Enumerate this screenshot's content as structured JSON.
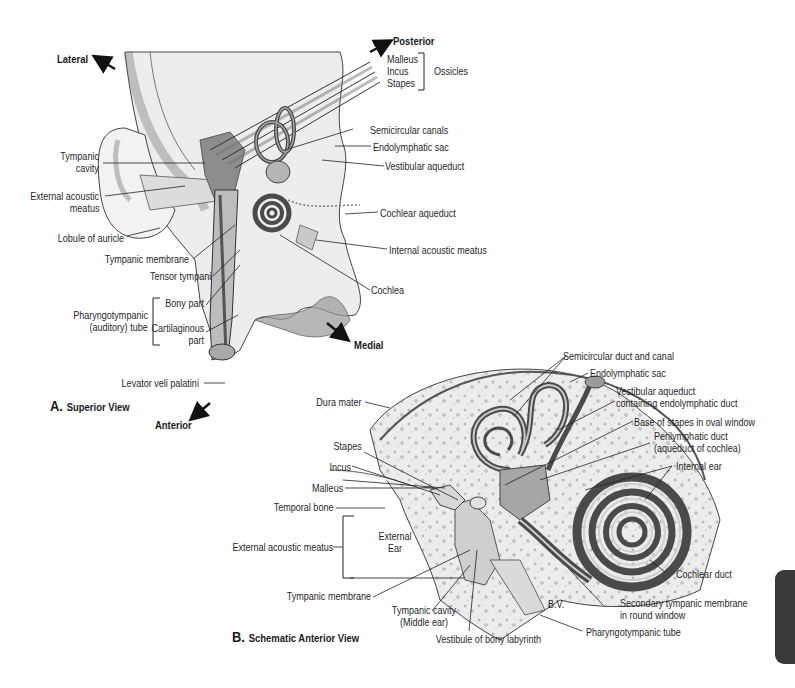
{
  "figure_a": {
    "caption_letter": "A.",
    "caption_text": "Superior View",
    "directions": {
      "lateral": "Lateral",
      "posterior": "Posterior",
      "medial": "Medial",
      "anterior": "Anterior"
    },
    "labels": {
      "malleus": "Malleus",
      "incus": "Incus",
      "stapes": "Stapes",
      "ossicles": "Ossicles",
      "semicircular_canals": "Semicircular canals",
      "endolymphatic_sac": "Endolymphatic sac",
      "vestibular_aqueduct": "Vestibular aqueduct",
      "cochlear_aqueduct": "Cochlear aqueduct",
      "internal_acoustic_meatus": "Internal acoustic meatus",
      "cochlea": "Cochlea",
      "tympanic_cavity_1": "Tympanic",
      "tympanic_cavity_2": "cavity",
      "external_acoustic_meatus_1": "External acoustic",
      "external_acoustic_meatus_2": "meatus",
      "lobule_of_auricle": "Lobule of auricle",
      "tympanic_membrane": "Tympanic membrane",
      "tensor_tympani": "Tensor tympani",
      "pharyngotympanic_1": "Pharyngotympanic",
      "pharyngotympanic_2": "(auditory) tube",
      "bony_part": "Bony part",
      "cartilaginous_1": "Cartilaginous",
      "cartilaginous_2": "part",
      "levator_veli_palatini": "Levator veli palatini",
      "signature": "B.V."
    }
  },
  "figure_b": {
    "caption_letter": "B.",
    "caption_text": "Schematic Anterior View",
    "labels": {
      "semicircular_duct_and_canal": "Semicircular duct and canal",
      "endolymphatic_sac": "Endolymphatic sac",
      "vestibular_aqueduct_1": "Vestibular aqueduct",
      "vestibular_aqueduct_2": "containing endolymphatic duct",
      "base_of_stapes": "Base of stapes in oval window",
      "perilymphatic_duct_1": "Perilymphatic duct",
      "perilymphatic_duct_2": "(aqueduct of cochlea)",
      "internal_ear": "Internal ear",
      "cochlear_duct": "Cochlear duct",
      "secondary_tympanic_1": "Secondary tympanic membrane",
      "secondary_tympanic_2": "in round window",
      "pharyngotympanic_tube": "Pharyngotympanic tube",
      "vestibule": "Vestibule of bony labyrinth",
      "tympanic_cavity_1": "Tympanic cavity",
      "tympanic_cavity_2": "(Middle ear)",
      "tympanic_membrane": "Tympanic membrane",
      "external_acoustic_meatus": "External acoustic meatus",
      "external_ear_1": "External",
      "external_ear_2": "Ear",
      "temporal_bone": "Temporal bone",
      "malleus": "Malleus",
      "incus": "Incus",
      "stapes": "Stapes",
      "dura_mater": "Dura mater",
      "signature": "B.V."
    }
  },
  "colors": {
    "bone_fill": "#e6e6e6",
    "bone_light": "#f1f1f1",
    "dark_structure": "#555555",
    "mid_structure": "#9a9a9a",
    "line": "#2a2a2a",
    "thumb_tab": "#3a3a3a"
  }
}
